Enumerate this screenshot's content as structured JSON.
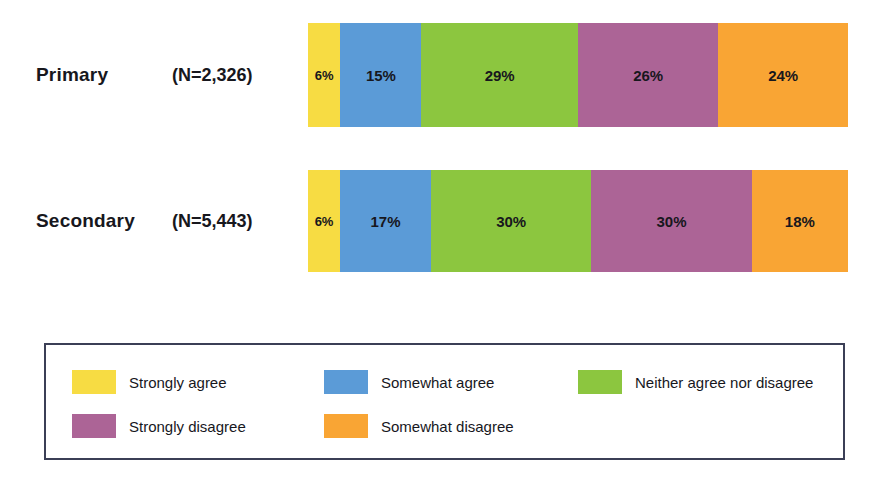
{
  "chart_data": {
    "type": "bar",
    "subtype": "100% stacked horizontal bar",
    "title": "",
    "xlabel": "",
    "ylabel": "",
    "xlim": [
      0,
      100
    ],
    "grid": false,
    "legend_position": "bottom",
    "categories": [
      "Primary",
      "Secondary"
    ],
    "category_counts": [
      "(N=2,326)",
      "(N=5,443)"
    ],
    "series": [
      {
        "name": "Strongly agree",
        "color": "#F7DC43",
        "values": [
          6,
          6
        ],
        "labels": [
          "6%",
          "6%"
        ]
      },
      {
        "name": "Somewhat agree",
        "color": "#5B9BD7",
        "values": [
          15,
          17
        ],
        "labels": [
          "15%",
          "17%"
        ]
      },
      {
        "name": "Neither agree nor disagree",
        "color": "#8CC63F",
        "values": [
          29,
          30
        ],
        "labels": [
          "29%",
          "30%"
        ]
      },
      {
        "name": "Strongly disagree",
        "color": "#AC6496",
        "values": [
          26,
          30
        ],
        "labels": [
          "26%",
          "30%"
        ]
      },
      {
        "name": "Somewhat disagree",
        "color": "#F9A534",
        "values": [
          24,
          18
        ],
        "labels": [
          "24%",
          "18%"
        ]
      }
    ]
  },
  "rows": [
    {
      "category": "Primary",
      "count": "(N=2,326)",
      "segments": [
        {
          "label": "6%",
          "value": 6,
          "color": "#F7DC43",
          "name": "strongly-agree"
        },
        {
          "label": "15%",
          "value": 15,
          "color": "#5B9BD7",
          "name": "somewhat-agree"
        },
        {
          "label": "29%",
          "value": 29,
          "color": "#8CC63F",
          "name": "neither-agree-nor-disagree"
        },
        {
          "label": "26%",
          "value": 26,
          "color": "#AC6496",
          "name": "strongly-disagree"
        },
        {
          "label": "24%",
          "value": 24,
          "color": "#F9A534",
          "name": "somewhat-disagree"
        }
      ]
    },
    {
      "category": "Secondary",
      "count": "(N=5,443)",
      "segments": [
        {
          "label": "6%",
          "value": 6,
          "color": "#F7DC43",
          "name": "strongly-agree"
        },
        {
          "label": "17%",
          "value": 17,
          "color": "#5B9BD7",
          "name": "somewhat-agree"
        },
        {
          "label": "30%",
          "value": 30,
          "color": "#8CC63F",
          "name": "neither-agree-nor-disagree"
        },
        {
          "label": "30%",
          "value": 30,
          "color": "#AC6496",
          "name": "strongly-disagree"
        },
        {
          "label": "18%",
          "value": 18,
          "color": "#F9A534",
          "name": "somewhat-disagree"
        }
      ]
    }
  ],
  "legend": {
    "border_color": "#3b3f56",
    "items": [
      {
        "label": "Strongly agree",
        "color": "#F7DC43",
        "name": "strongly-agree"
      },
      {
        "label": "Somewhat agree",
        "color": "#5B9BD7",
        "name": "somewhat-agree"
      },
      {
        "label": "Neither agree nor disagree",
        "color": "#8CC63F",
        "name": "neither-agree-nor-disagree"
      },
      {
        "label": "Strongly disagree",
        "color": "#AC6496",
        "name": "strongly-disagree"
      },
      {
        "label": "Somewhat disagree",
        "color": "#F9A534",
        "name": "somewhat-disagree"
      }
    ]
  }
}
